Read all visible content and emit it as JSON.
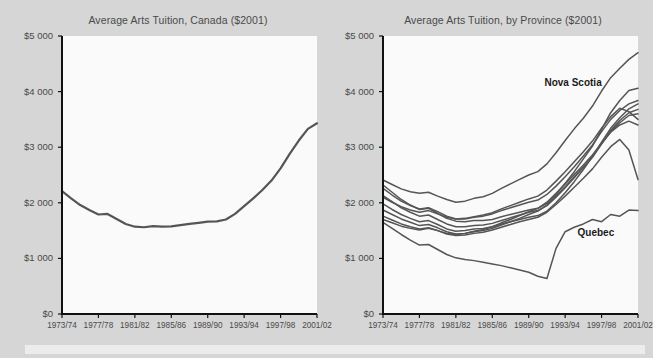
{
  "figure": {
    "background_color": "#d6d6d6",
    "plot_background_color": "#fafafa",
    "line_color": "#555555",
    "axis_color": "#111111",
    "text_color": "#4a4a4a"
  },
  "chart_data": [
    {
      "type": "line",
      "id": "canada",
      "title": "Average Arts Tuition, Canada ($2001)",
      "xlabel": "",
      "ylabel": "",
      "ylim": [
        0,
        5000
      ],
      "yticks": [
        0,
        1000,
        2000,
        3000,
        4000,
        5000
      ],
      "ytick_labels": [
        "$0",
        "$1 000",
        "$2 000",
        "$3 000",
        "$4 000",
        "$5 000"
      ],
      "xtick_labels": [
        "1973/74",
        "1977/78",
        "1981/82",
        "1985/86",
        "1989/90",
        "1993/94",
        "1997/98",
        "2001/02"
      ],
      "x": [
        "1973/74",
        "1974/75",
        "1975/76",
        "1976/77",
        "1977/78",
        "1978/79",
        "1979/80",
        "1980/81",
        "1981/82",
        "1982/83",
        "1983/84",
        "1984/85",
        "1985/86",
        "1986/87",
        "1987/88",
        "1988/89",
        "1989/90",
        "1990/91",
        "1991/92",
        "1992/93",
        "1993/94",
        "1994/95",
        "1995/96",
        "1996/97",
        "1997/98",
        "1998/99",
        "1999/00",
        "2000/01",
        "2001/02"
      ],
      "grid": false,
      "legend": "none",
      "series": [
        {
          "name": "Canada",
          "values": [
            2210,
            2080,
            1960,
            1870,
            1790,
            1800,
            1710,
            1620,
            1570,
            1560,
            1580,
            1570,
            1575,
            1600,
            1620,
            1640,
            1660,
            1665,
            1700,
            1800,
            1940,
            2080,
            2230,
            2400,
            2620,
            2880,
            3120,
            3330,
            3430
          ]
        }
      ]
    },
    {
      "type": "line",
      "id": "by-province",
      "title": "Average Arts Tuition, by Province ($2001)",
      "xlabel": "",
      "ylabel": "",
      "ylim": [
        0,
        5000
      ],
      "yticks": [
        0,
        1000,
        2000,
        3000,
        4000,
        5000
      ],
      "ytick_labels": [
        "$0",
        "$1 000",
        "$2 000",
        "$3 000",
        "$4 000",
        "$5 000"
      ],
      "xtick_labels": [
        "1973/74",
        "1977/78",
        "1981/82",
        "1985/86",
        "1989/90",
        "1993/94",
        "1997/98",
        "2001/02"
      ],
      "x": [
        "1973/74",
        "1974/75",
        "1975/76",
        "1976/77",
        "1977/78",
        "1978/79",
        "1979/80",
        "1980/81",
        "1981/82",
        "1982/83",
        "1983/84",
        "1984/85",
        "1985/86",
        "1986/87",
        "1987/88",
        "1988/89",
        "1989/90",
        "1990/91",
        "1991/92",
        "1992/93",
        "1993/94",
        "1994/95",
        "1995/96",
        "1996/97",
        "1997/98",
        "1998/99",
        "1999/00",
        "2000/01",
        "2001/02"
      ],
      "grid": false,
      "legend": "none",
      "annotations": [
        {
          "text": "Nova Scotia",
          "x": "1996/97",
          "y": 4150
        },
        {
          "text": "Quebec",
          "x": "1997/98",
          "y": 1450
        }
      ],
      "series": [
        {
          "name": "Nova Scotia",
          "values": [
            2410,
            2330,
            2250,
            2200,
            2170,
            2190,
            2120,
            2060,
            2010,
            2030,
            2080,
            2110,
            2170,
            2260,
            2340,
            2420,
            2500,
            2560,
            2700,
            2900,
            3120,
            3330,
            3520,
            3740,
            4010,
            4250,
            4420,
            4580,
            4700
          ]
        },
        {
          "name": "Ontario",
          "values": [
            2320,
            2190,
            2060,
            1960,
            1880,
            1900,
            1810,
            1720,
            1670,
            1660,
            1680,
            1680,
            1700,
            1750,
            1790,
            1830,
            1870,
            1900,
            1990,
            2150,
            2350,
            2560,
            2790,
            3020,
            3320,
            3620,
            3840,
            4020,
            4060
          ]
        },
        {
          "name": "Alberta",
          "values": [
            1980,
            1880,
            1790,
            1720,
            1660,
            1680,
            1610,
            1530,
            1490,
            1500,
            1530,
            1540,
            1570,
            1620,
            1660,
            1700,
            1740,
            1770,
            1850,
            2000,
            2180,
            2380,
            2600,
            2830,
            3090,
            3340,
            3530,
            3690,
            3780
          ]
        },
        {
          "name": "British Columbia",
          "values": [
            1870,
            1790,
            1710,
            1650,
            1590,
            1610,
            1550,
            1480,
            1440,
            1450,
            1480,
            1500,
            1540,
            1600,
            1660,
            1720,
            1790,
            1850,
            1960,
            2120,
            2290,
            2470,
            2640,
            2820,
            3060,
            3300,
            3480,
            3620,
            3680
          ]
        },
        {
          "name": "Saskatchewan",
          "values": [
            2260,
            2140,
            2030,
            1950,
            1890,
            1910,
            1840,
            1760,
            1710,
            1710,
            1740,
            1760,
            1800,
            1860,
            1910,
            1960,
            2010,
            2050,
            2150,
            2300,
            2470,
            2650,
            2840,
            3040,
            3280,
            3500,
            3660,
            3780,
            3840
          ]
        },
        {
          "name": "New Brunswick",
          "values": [
            2100,
            2010,
            1930,
            1870,
            1830,
            1860,
            1800,
            1740,
            1710,
            1720,
            1750,
            1780,
            1820,
            1890,
            1950,
            2010,
            2070,
            2120,
            2230,
            2390,
            2560,
            2740,
            2920,
            3110,
            3340,
            3550,
            3700,
            3640,
            3500
          ]
        },
        {
          "name": "Newfoundland",
          "values": [
            1760,
            1690,
            1620,
            1570,
            1530,
            1550,
            1500,
            1440,
            1410,
            1420,
            1450,
            1470,
            1510,
            1560,
            1610,
            1660,
            1700,
            1740,
            1830,
            1970,
            2120,
            2280,
            2440,
            2610,
            2820,
            3010,
            3140,
            2950,
            2420
          ]
        },
        {
          "name": "Manitoba",
          "values": [
            2130,
            2020,
            1910,
            1830,
            1760,
            1780,
            1700,
            1620,
            1570,
            1570,
            1590,
            1600,
            1630,
            1680,
            1730,
            1780,
            1830,
            1860,
            1950,
            2100,
            2270,
            2450,
            2640,
            2830,
            3060,
            3280,
            3440,
            3570,
            3600
          ]
        },
        {
          "name": "Prince Edward Island",
          "values": [
            1700,
            1640,
            1580,
            1540,
            1510,
            1540,
            1500,
            1450,
            1430,
            1450,
            1490,
            1520,
            1570,
            1640,
            1700,
            1770,
            1840,
            1900,
            2010,
            2170,
            2340,
            2510,
            2680,
            2860,
            3070,
            3270,
            3400,
            3470,
            3400
          ]
        },
        {
          "name": "Quebec",
          "values": [
            1650,
            1540,
            1430,
            1330,
            1240,
            1250,
            1160,
            1070,
            1010,
            980,
            960,
            930,
            900,
            870,
            830,
            790,
            750,
            680,
            640,
            1180,
            1480,
            1560,
            1620,
            1700,
            1660,
            1790,
            1760,
            1870,
            1860
          ]
        }
      ]
    }
  ]
}
